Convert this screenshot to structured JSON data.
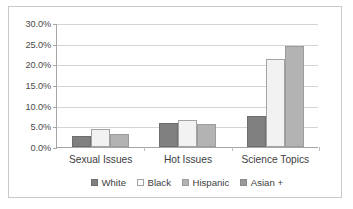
{
  "chart_data": {
    "type": "bar",
    "title": "",
    "subtitle": "",
    "xlabel": "",
    "ylabel": "",
    "categories": [
      "Sexual Issues",
      "Hot Issues",
      "Science Topics"
    ],
    "series": [
      {
        "name": "White",
        "color": "#808080",
        "values": [
          2.7,
          5.9,
          7.4
        ]
      },
      {
        "name": "Black",
        "color": "#f2f2f2",
        "values": [
          4.3,
          6.6,
          21.2
        ]
      },
      {
        "name": "Hispanic",
        "color": "#b3b3b3",
        "values": [
          3.1,
          5.6,
          24.5
        ]
      },
      {
        "name": "Asian +",
        "color": "#9a9a9a",
        "values": [
          null,
          null,
          null
        ]
      }
    ],
    "ylim": [
      0,
      30
    ],
    "ytick_values": [
      0,
      5,
      10,
      15,
      20,
      25,
      30
    ],
    "ytick_labels": [
      "0.0%",
      "5.0%",
      "10.0%",
      "15.0%",
      "20.0%",
      "25.0%",
      "30.0%"
    ],
    "grid": true,
    "grid_axis": "y",
    "legend_position": "bottom",
    "value_format": "percent",
    "annotations": []
  },
  "legend": {
    "entries": [
      {
        "label": "White",
        "swatch": "legend-swatch-white"
      },
      {
        "label": "Black",
        "swatch": "legend-swatch-black"
      },
      {
        "label": "Hispanic",
        "swatch": "legend-swatch-hispanic"
      },
      {
        "label": "Asian +",
        "swatch": "legend-swatch-asian"
      }
    ]
  }
}
